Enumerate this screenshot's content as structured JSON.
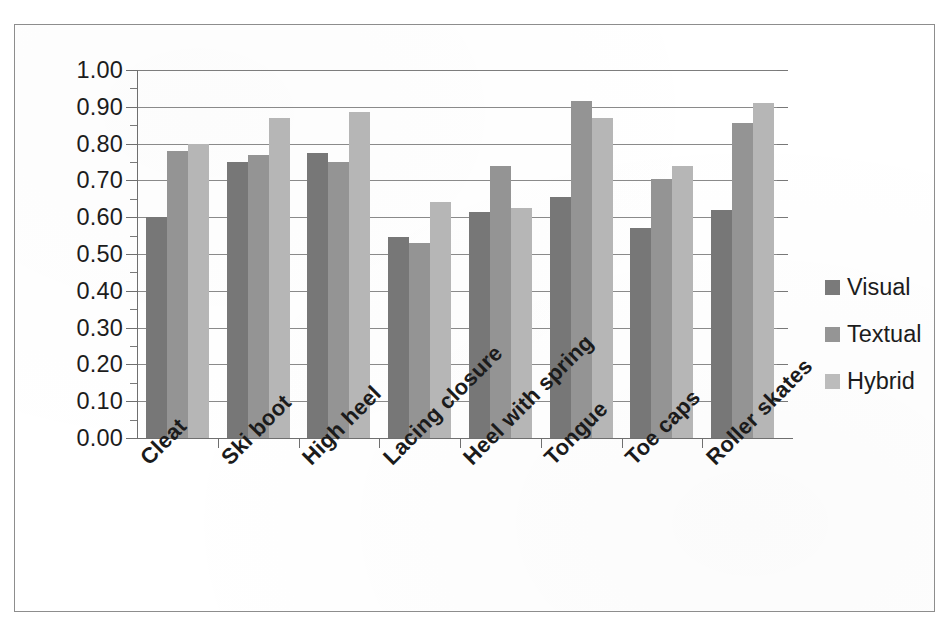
{
  "chart_data": {
    "type": "bar",
    "title": "",
    "xlabel": "",
    "ylabel": "",
    "ylim": [
      0.0,
      1.0
    ],
    "ytick_step": 0.1,
    "minor_tick_step": 0.05,
    "grid": true,
    "legend_position": "right",
    "orientation": "vertical",
    "grouping": "clustered",
    "categories": [
      "Cleat",
      "Ski boot",
      "High heel",
      "Lacing closure",
      "Heel with spring",
      "Tongue",
      "Toe caps",
      "Roller skates"
    ],
    "ytick_labels": [
      "0.00",
      "0.10",
      "0.20",
      "0.30",
      "0.40",
      "0.50",
      "0.60",
      "0.70",
      "0.80",
      "0.90",
      "1.00"
    ],
    "ytick_values": [
      0.0,
      0.1,
      0.2,
      0.3,
      0.4,
      0.5,
      0.6,
      0.7,
      0.8,
      0.9,
      1.0
    ],
    "series": [
      {
        "name": "Visual",
        "color": "#777777",
        "values": [
          0.6,
          0.75,
          0.775,
          0.545,
          0.615,
          0.655,
          0.57,
          0.62
        ]
      },
      {
        "name": "Textual",
        "color": "#949494",
        "values": [
          0.78,
          0.77,
          0.75,
          0.53,
          0.74,
          0.915,
          0.705,
          0.855
        ]
      },
      {
        "name": "Hybrid",
        "color": "#b6b6b6",
        "values": [
          0.8,
          0.87,
          0.885,
          0.64,
          0.625,
          0.87,
          0.74,
          0.91
        ]
      }
    ]
  },
  "legend": {
    "items": [
      {
        "label": "Visual",
        "color": "#7a7a7a"
      },
      {
        "label": "Textual",
        "color": "#959595"
      },
      {
        "label": "Hybrid",
        "color": "#bcbcbc"
      }
    ]
  }
}
